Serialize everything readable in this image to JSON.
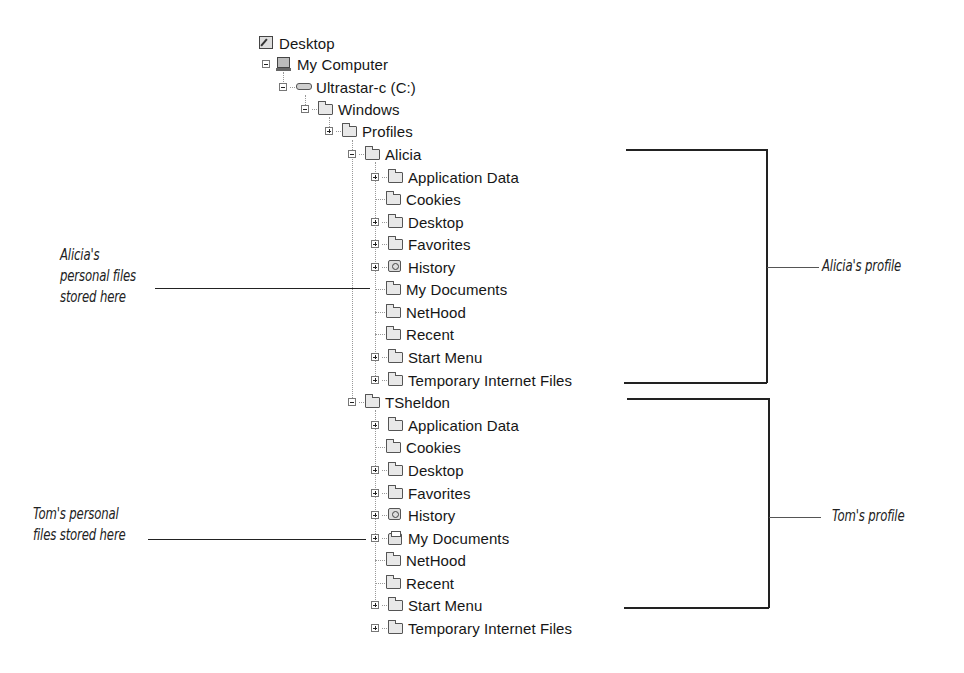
{
  "tree": {
    "root": {
      "label": "Desktop",
      "icon": "desktop-icon"
    },
    "my_computer": {
      "label": "My Computer",
      "icon": "computer-icon"
    },
    "drive": {
      "label": "Ultrastar-c (C:)",
      "icon": "hard-drive-icon"
    },
    "windows": {
      "label": "Windows",
      "icon": "folder-icon"
    },
    "profiles": {
      "label": "Profiles",
      "icon": "folder-icon"
    },
    "users": [
      {
        "name": "Alicia",
        "children": [
          {
            "label": "Application Data",
            "icon": "folder-icon",
            "expandable": true
          },
          {
            "label": "Cookies",
            "icon": "folder-icon",
            "expandable": false
          },
          {
            "label": "Desktop",
            "icon": "folder-icon",
            "expandable": true
          },
          {
            "label": "Favorites",
            "icon": "folder-icon",
            "expandable": true
          },
          {
            "label": "History",
            "icon": "history-folder-icon",
            "expandable": true
          },
          {
            "label": "My Documents",
            "icon": "folder-icon",
            "expandable": false
          },
          {
            "label": "NetHood",
            "icon": "folder-icon",
            "expandable": false
          },
          {
            "label": "Recent",
            "icon": "folder-icon",
            "expandable": false
          },
          {
            "label": "Start Menu",
            "icon": "folder-icon",
            "expandable": true
          },
          {
            "label": "Temporary Internet Files",
            "icon": "folder-icon",
            "expandable": true
          }
        ]
      },
      {
        "name": "TSheldon",
        "children": [
          {
            "label": "Application Data",
            "icon": "folder-icon",
            "expandable": true
          },
          {
            "label": "Cookies",
            "icon": "folder-icon",
            "expandable": false
          },
          {
            "label": "Desktop",
            "icon": "folder-icon",
            "expandable": true
          },
          {
            "label": "Favorites",
            "icon": "folder-icon",
            "expandable": true
          },
          {
            "label": "History",
            "icon": "history-folder-icon",
            "expandable": true
          },
          {
            "label": "My Documents",
            "icon": "my-documents-icon",
            "expandable": true
          },
          {
            "label": "NetHood",
            "icon": "folder-icon",
            "expandable": false
          },
          {
            "label": "Recent",
            "icon": "folder-icon",
            "expandable": false
          },
          {
            "label": "Start Menu",
            "icon": "folder-icon",
            "expandable": true
          },
          {
            "label": "Temporary Internet Files",
            "icon": "folder-icon",
            "expandable": true
          }
        ]
      }
    ]
  },
  "callouts": {
    "alicia_files": [
      "Alicia's",
      "personal files",
      "stored here"
    ],
    "tom_files": [
      "Tom's personal",
      "files stored here"
    ],
    "alicia_profile": "Alicia's profile",
    "tom_profile": "Tom's profile"
  }
}
